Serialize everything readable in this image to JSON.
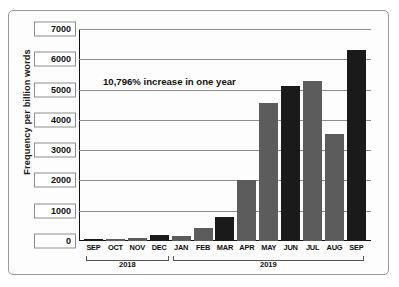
{
  "chart_data": {
    "type": "bar",
    "title": "",
    "xlabel": "",
    "ylabel": "Frequency per billion words",
    "ylim": [
      0,
      7000
    ],
    "ytick_labels": [
      "7000",
      "6000",
      "5000",
      "4000",
      "3000",
      "2000",
      "1000",
      "0"
    ],
    "ytick_values": [
      7000,
      6000,
      5000,
      4000,
      3000,
      2000,
      1000,
      0
    ],
    "grid": true,
    "legend": "none",
    "categories": [
      "SEP",
      "OCT",
      "NOV",
      "DEC",
      "JAN",
      "FEB",
      "MAR",
      "APR",
      "MAY",
      "JUN",
      "JUL",
      "AUG",
      "SEP"
    ],
    "values": [
      60,
      80,
      110,
      200,
      160,
      420,
      800,
      2000,
      4550,
      5130,
      5280,
      3520,
      6320
    ],
    "bar_colors": [
      "dark",
      "gray",
      "gray",
      "dark",
      "gray",
      "gray",
      "dark",
      "gray",
      "gray",
      "dark",
      "gray",
      "gray",
      "dark"
    ],
    "annotations": [
      {
        "text": "10,796% increase in one year"
      }
    ],
    "group_labels": [
      {
        "label": "2018",
        "start_index": 0,
        "end_index": 3
      },
      {
        "label": "2019",
        "start_index": 4,
        "end_index": 12
      }
    ]
  },
  "colors": {
    "bar_dark": "#1a1a1a",
    "bar_gray": "#5c5c5c",
    "grid": "#8d8d8d",
    "axis": "#111111",
    "frame": "#9a9a9a",
    "background": "#ffffff"
  }
}
